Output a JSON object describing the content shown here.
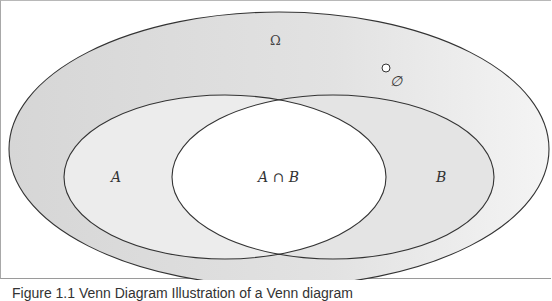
{
  "diagram": {
    "type": "venn",
    "universe_label": "Ω",
    "empty_set_label": "∅",
    "sets": [
      {
        "name": "A",
        "label": "A"
      },
      {
        "name": "B",
        "label": "B"
      }
    ],
    "intersection_label": "A ∩ B",
    "colors": {
      "universe_fill": "#d9d9d9",
      "set_fill": "#ececec",
      "intersection_fill": "#ffffff",
      "stroke": "#333333"
    }
  },
  "caption": "Figure 1.1 Venn Diagram  Illustration of a Venn diagram"
}
